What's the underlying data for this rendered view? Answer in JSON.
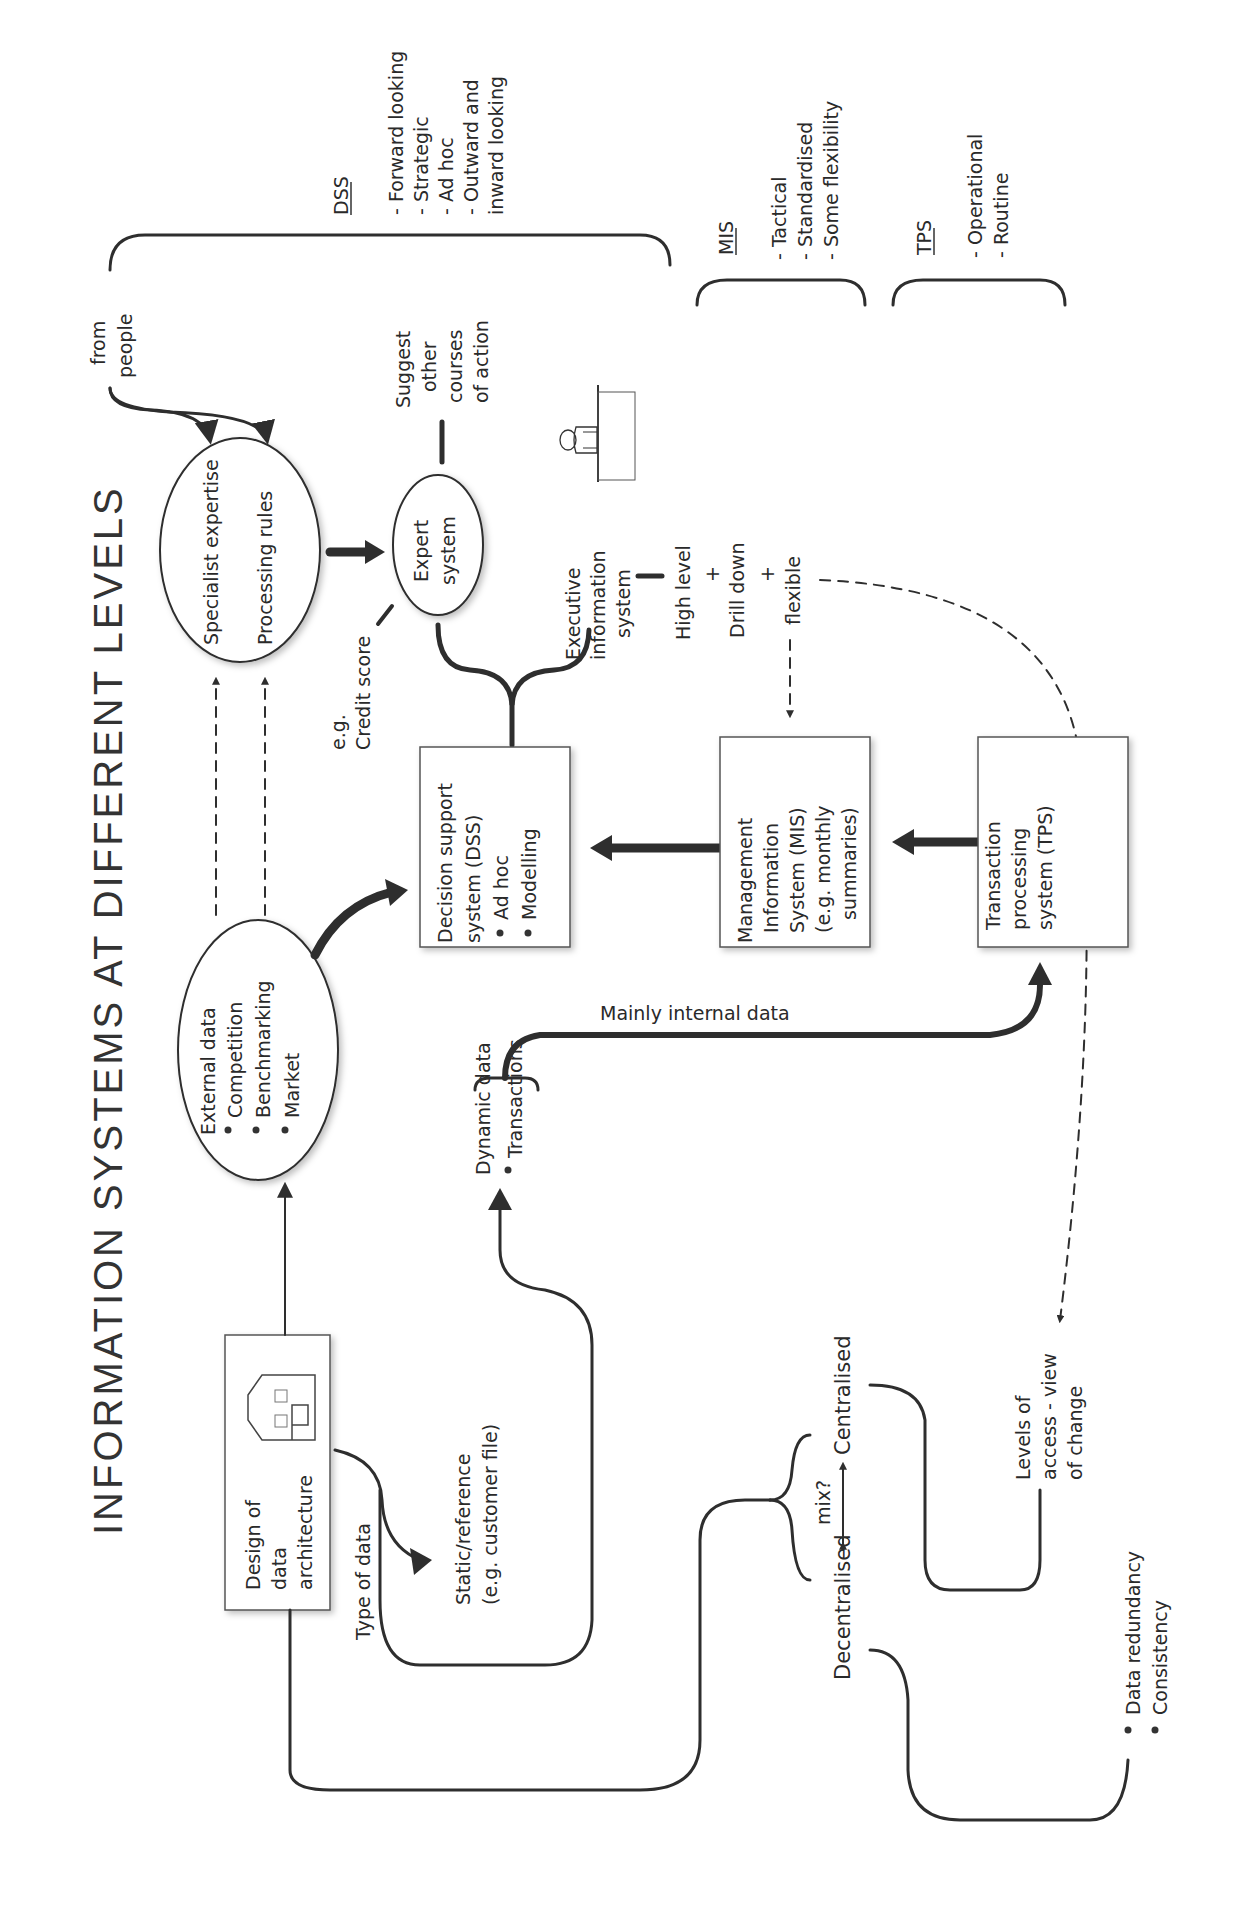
{
  "title": "INFORMATION SYSTEMS AT DIFFERENT LEVELS",
  "nodes": {
    "external_data": {
      "heading": "External data",
      "bullets": [
        "Competition",
        "Benchmarking",
        "Market"
      ]
    },
    "specialist": {
      "line1": "Specialist expertise",
      "line2": "Processing rules"
    },
    "from_people": [
      "from",
      "people"
    ],
    "expert_system": [
      "Expert",
      "system"
    ],
    "suggest": [
      "Suggest",
      "other",
      "courses",
      "of action"
    ],
    "credit_score": [
      "e.g.",
      "Credit score"
    ],
    "eis": [
      "Executive",
      "information",
      "system"
    ],
    "eis_features": [
      "High level",
      "+",
      "Drill down",
      "+",
      "flexible"
    ],
    "dss_box": {
      "lines": [
        "Decision support",
        "system (DSS)"
      ],
      "bullets": [
        "Ad hoc",
        "Modelling"
      ]
    },
    "mis_box": [
      "Management",
      "Information",
      "System (MIS)",
      "(e.g. monthly",
      "summaries)"
    ],
    "tps_box": [
      "Transaction",
      "processing",
      "system (TPS)"
    ],
    "design_box": [
      "Design of",
      "data",
      "architecture"
    ],
    "type_of_data": "Type of data",
    "static_ref": [
      "Static/reference",
      "(e.g. customer file)"
    ],
    "dynamic_data": {
      "heading": "Dynamic data",
      "bullets": [
        "Transactions"
      ]
    },
    "mainly_internal": "Mainly internal data",
    "decentralised": "Decentralised",
    "mix": "mix?",
    "centralised": "Centralised",
    "levels_access": [
      "Levels of",
      "access - view",
      "of change"
    ],
    "redundancy": [
      "Data redundancy",
      "Consistency"
    ]
  },
  "legend": {
    "dss": {
      "label": "DSS",
      "items": [
        "- Forward looking",
        "- Strategic",
        "- Ad hoc",
        "- Outward and",
        "  inward looking"
      ]
    },
    "mis": {
      "label": "MIS",
      "items": [
        "- Tactical",
        "- Standardised",
        "- Some flexibility"
      ]
    },
    "tps": {
      "label": "TPS",
      "items": [
        "- Operational",
        "- Routine"
      ]
    }
  },
  "colors": {
    "ink": "#2e2e2e",
    "background": "#ffffff",
    "box_border": "#555555"
  }
}
